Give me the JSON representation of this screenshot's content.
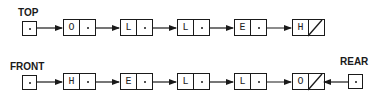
{
  "stack": {
    "label": "TOP",
    "nodes": [
      {
        "value": "O",
        "next": "pointer"
      },
      {
        "value": "L",
        "next": "pointer"
      },
      {
        "value": "L",
        "next": "pointer"
      },
      {
        "value": "E",
        "next": "pointer"
      },
      {
        "value": "H",
        "next": "null"
      }
    ]
  },
  "queue": {
    "front_label": "FRONT",
    "rear_label": "REAR",
    "nodes": [
      {
        "value": "H",
        "next": "pointer"
      },
      {
        "value": "E",
        "next": "pointer"
      },
      {
        "value": "L",
        "next": "pointer"
      },
      {
        "value": "L",
        "next": "pointer"
      },
      {
        "value": "O",
        "next": "null"
      }
    ]
  },
  "colors": {
    "line": "#1a1a1a",
    "background": "#ffffff"
  }
}
